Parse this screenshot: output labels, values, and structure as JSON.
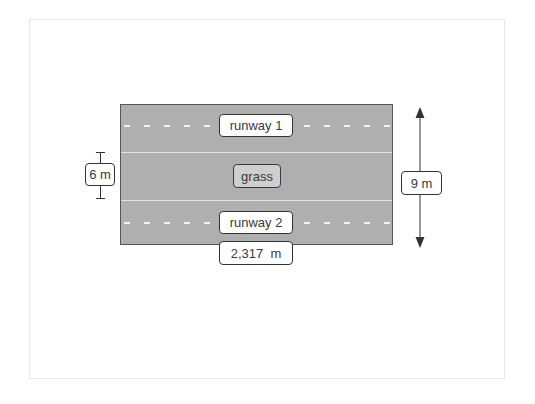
{
  "diagram": {
    "title": "",
    "regions": [
      {
        "id": "runway-1",
        "label": "runway 1",
        "type": "runway"
      },
      {
        "id": "grass",
        "label": "grass",
        "type": "grass"
      },
      {
        "id": "runway-2",
        "label": "runway 2",
        "type": "runway"
      }
    ],
    "labels": {
      "runway_1": "runway 1",
      "grass": "grass",
      "runway_2": "runway 2",
      "length": "2,317  m",
      "grass_width": "6 m",
      "total_width": "9 m"
    },
    "dimensions": {
      "length": {
        "value": 2317,
        "unit": "m",
        "text": "2,317 m"
      },
      "grass_width": {
        "value": 6,
        "unit": "m",
        "text": "6 m"
      },
      "total_width": {
        "value": 9,
        "unit": "m",
        "text": "9 m"
      }
    },
    "colors": {
      "field_fill": "#afafaf",
      "field_border": "#555555",
      "dash_color": "#f2f2f2",
      "label_bg": "#ffffff",
      "grass_label_bg": "#cfcfcf",
      "line_color": "#333333"
    }
  }
}
